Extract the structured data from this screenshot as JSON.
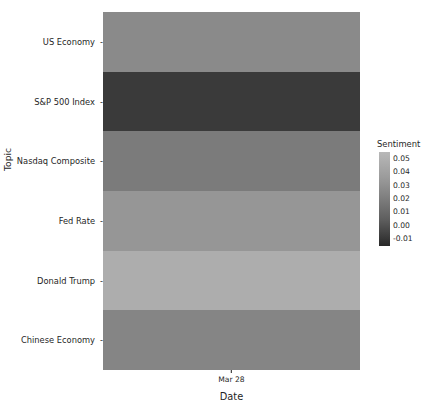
{
  "chart_data": {
    "type": "heatmap",
    "title": "",
    "xlabel": "Date",
    "ylabel": "Topic",
    "x_tick_labels": [
      "Mar 28"
    ],
    "x_tick_positions": [
      0.5
    ],
    "categories_y": [
      "US Economy",
      "S&P 500 Index",
      "Nasdaq Composite",
      "Fed Rate",
      "Donald Trump",
      "Chinese Economy"
    ],
    "values": [
      0.032,
      -0.005,
      0.022,
      0.038,
      0.047,
      0.028
    ],
    "cells": [
      {
        "topic": "US Economy",
        "date": "Mar 28",
        "sentiment": 0.032,
        "color": "#8a8a8a"
      },
      {
        "topic": "S&P 500 Index",
        "date": "Mar 28",
        "sentiment": -0.005,
        "color": "#3a3a3a"
      },
      {
        "topic": "Nasdaq Composite",
        "date": "Mar 28",
        "sentiment": 0.022,
        "color": "#7b7b7b"
      },
      {
        "topic": "Fed Rate",
        "date": "Mar 28",
        "sentiment": 0.038,
        "color": "#969696"
      },
      {
        "topic": "Donald Trump",
        "date": "Mar 28",
        "sentiment": 0.047,
        "color": "#adadad"
      },
      {
        "topic": "Chinese Economy",
        "date": "Mar 28",
        "sentiment": 0.028,
        "color": "#858585"
      }
    ],
    "colorbar": {
      "label": "Sentiment",
      "tick_labels": [
        "0.05",
        "0.04",
        "0.03",
        "0.02",
        "0.01",
        "0.00",
        "-0.01"
      ],
      "vmin": -0.01,
      "vmax": 0.05,
      "colormap": "grays",
      "gradient_top_color": "#b8b8b8",
      "gradient_bottom_color": "#282828",
      "position": "right"
    },
    "grid": false,
    "legend_position": "right"
  },
  "axes": {
    "y_title": "Topic",
    "x_title": "Date",
    "tick_dash": "-"
  }
}
